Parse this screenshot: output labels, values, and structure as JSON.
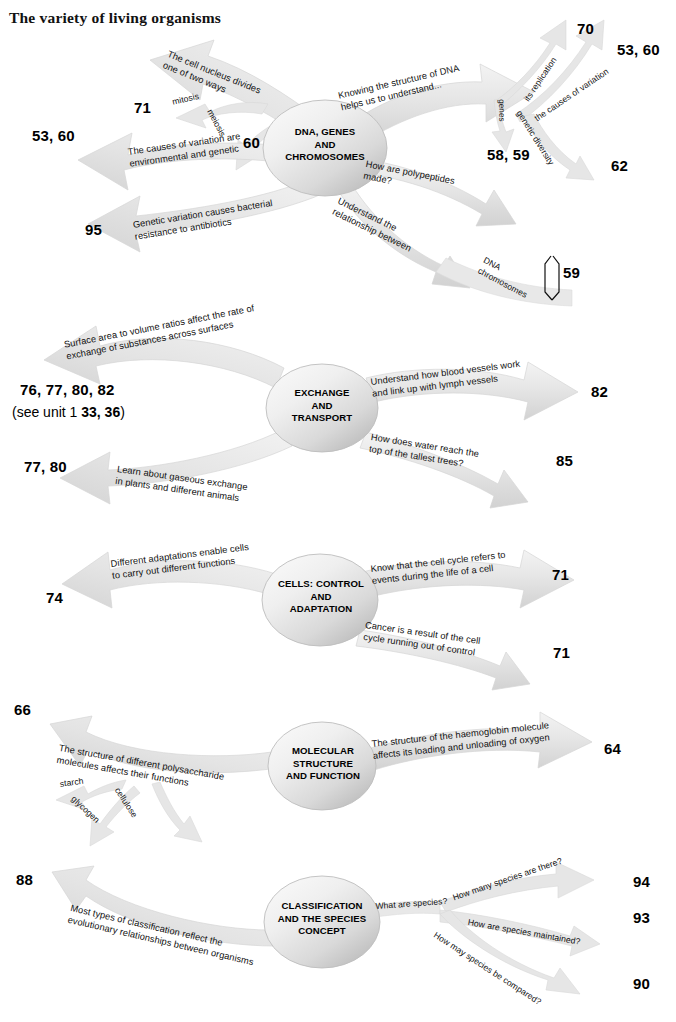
{
  "page": {
    "title": "The variety of living organisms",
    "width": 676,
    "height": 1022,
    "background": "#ffffff",
    "arrow_fill": "#e3e3e3",
    "arrow_stroke": "#cfcfcf",
    "hub_fill": "#e9e9e9",
    "text_color": "#111111"
  },
  "sections": [
    {
      "id": "dna-genes-chromosomes",
      "hub": "DNA, GENES\nAND\nCHROMOSOMES",
      "branches": [
        {
          "id": "cell-nucleus-divides",
          "text": "The cell nucleus divides\none of two ways",
          "page": "",
          "side": "up-left"
        },
        {
          "id": "mitosis",
          "text": "mitosis",
          "page": "71",
          "side": "up-left"
        },
        {
          "id": "meiosis",
          "text": "meiosis",
          "page": "60",
          "side": "up-left"
        },
        {
          "id": "causes-of-variation",
          "text": "The causes of variation are\nenvironmental and genetic",
          "page": "53, 60",
          "side": "left"
        },
        {
          "id": "genetic-variation-bacterial",
          "text": "Genetic variation causes bacterial\nresistance to antibiotics",
          "page": "95",
          "side": "down-left"
        },
        {
          "id": "knowing-structure-dna",
          "text": "Knowing the structure of  DNA\nhelps us to understand...",
          "page": "",
          "side": "up-right"
        },
        {
          "id": "its-replication",
          "text": "its replication",
          "page": "70",
          "side": "up-right"
        },
        {
          "id": "causes-of-variation-right",
          "text": "the causes of variation",
          "page": "53, 60",
          "side": "up-right"
        },
        {
          "id": "genes",
          "text": "genes",
          "page": "58, 59",
          "side": "down-right"
        },
        {
          "id": "genetic-diversity",
          "text": "genetic diversity",
          "page": "62",
          "side": "down-right"
        },
        {
          "id": "how-are-polypeptides-made",
          "text": "How are polypeptides\nmade?",
          "page": "58, 59",
          "side": "right"
        },
        {
          "id": "understand-relationship",
          "text": "Understand the\nrelationship between",
          "page": "",
          "side": "down-right"
        },
        {
          "id": "dna-chromosomes",
          "text": "DNA\nchromosomes",
          "page": "59",
          "side": "down-right",
          "bracket": true
        }
      ]
    },
    {
      "id": "exchange-and-transport",
      "hub": "EXCHANGE\nAND\nTRANSPORT",
      "branches": [
        {
          "id": "surface-area-volume",
          "text": "Surface area to volume ratios affect the rate of\nexchange of substances across surfaces",
          "page": "76, 77, 80, 82",
          "page_note_prefix": "(see unit 1 ",
          "page_note_bold": "33, 36",
          "page_note_suffix": ")",
          "side": "up-left"
        },
        {
          "id": "gaseous-exchange",
          "text": "Learn about gaseous exchange\nin plants and different animals",
          "page": "77, 80",
          "side": "down-left"
        },
        {
          "id": "blood-vessels",
          "text": "Understand how blood vessels work\nand link up with lymph vessels",
          "page": "82",
          "side": "up-right"
        },
        {
          "id": "water-tallest-trees",
          "text": "How does water reach the\ntop of the tallest trees?",
          "page": "85",
          "side": "down-right"
        }
      ]
    },
    {
      "id": "cells-control-and-adaptation",
      "hub": "CELLS: CONTROL\nAND\nADAPTATION",
      "branches": [
        {
          "id": "different-adaptations",
          "text": "Different adaptations enable cells\nto carry out different functions",
          "page": "74",
          "side": "left"
        },
        {
          "id": "cell-cycle-events",
          "text": "Know that the cell cycle refers to\nevents during  the life of a cell",
          "page": "71",
          "side": "up-right"
        },
        {
          "id": "cancer-cell-cycle",
          "text": "Cancer is a  result of the cell\ncycle running out of  control",
          "page": "71",
          "side": "down-right"
        }
      ]
    },
    {
      "id": "molecular-structure-and-function",
      "hub": "MOLECULAR\nSTRUCTURE\nAND FUNCTION",
      "branches": [
        {
          "id": "polysaccharide-structure",
          "text": "The structure of different polysaccharide\nmolecules affects their functions",
          "page": "66",
          "side": "left"
        },
        {
          "id": "starch",
          "text": "starch",
          "page": "",
          "side": "left"
        },
        {
          "id": "glycogen",
          "text": "glycogen",
          "page": "",
          "side": "down-left"
        },
        {
          "id": "cellulose",
          "text": "cellulose",
          "page": "",
          "side": "down-left"
        },
        {
          "id": "haemoglobin",
          "text": "The structure of the haemoglobin molecule\naffects its loading and unloading of oxygen",
          "page": "64",
          "side": "right"
        }
      ]
    },
    {
      "id": "classification-and-the-species-concept",
      "hub": "CLASSIFICATION\nAND THE SPECIES\nCONCEPT",
      "branches": [
        {
          "id": "types-of-classification",
          "text": "Most types of classification reflect the\nevolutionary relationships between organisms",
          "page": "88",
          "side": "left"
        },
        {
          "id": "what-are-species",
          "text": "What are species?",
          "page": "",
          "side": "right"
        },
        {
          "id": "how-many-species",
          "text": "How many species are there?",
          "page": "94",
          "side": "up-right"
        },
        {
          "id": "how-species-maintained",
          "text": "How are species maintained?",
          "page": "93",
          "side": "right"
        },
        {
          "id": "how-species-compared",
          "text": "How may species be compared?",
          "page": "90",
          "side": "down-right"
        }
      ]
    }
  ]
}
